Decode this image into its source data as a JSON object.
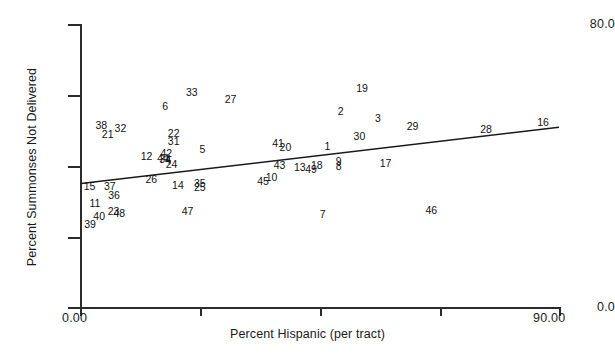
{
  "chart_data": {
    "type": "scatter",
    "title": "",
    "xlabel": "Percent Hispanic (per tract)",
    "ylabel": "Percent Summonses Not Delivered",
    "xlim": [
      0,
      90
    ],
    "ylim": [
      0,
      80
    ],
    "grid": false,
    "legend": "none",
    "marker_style": "numeric-text-label",
    "xtick_labels": [
      "0.00",
      "90.00"
    ],
    "xticks": [
      0,
      22.5,
      45,
      67.5,
      90
    ],
    "ytick_labels": [
      "80.0",
      "",
      "",
      "",
      "0.0"
    ],
    "yticks": [
      80,
      60,
      40,
      20,
      0
    ],
    "annotations": [
      {
        "label": "33",
        "x": 21.0,
        "y": 60.7
      },
      {
        "label": "27",
        "x": 28.3,
        "y": 58.8
      },
      {
        "label": "19",
        "x": 53.0,
        "y": 61.9
      },
      {
        "label": "6",
        "x": 16.0,
        "y": 56.8
      },
      {
        "label": "2",
        "x": 49.0,
        "y": 55.3
      },
      {
        "label": "3",
        "x": 56.0,
        "y": 53.4
      },
      {
        "label": "38",
        "x": 4.0,
        "y": 51.4
      },
      {
        "label": "32",
        "x": 7.6,
        "y": 50.6
      },
      {
        "label": "21",
        "x": 5.2,
        "y": 48.9
      },
      {
        "label": "29",
        "x": 62.5,
        "y": 51.1
      },
      {
        "label": "28",
        "x": 76.3,
        "y": 50.3
      },
      {
        "label": "16",
        "x": 87.0,
        "y": 52.4
      },
      {
        "label": "22",
        "x": 17.6,
        "y": 49.2
      },
      {
        "label": "31",
        "x": 17.6,
        "y": 47.0
      },
      {
        "label": "30",
        "x": 52.5,
        "y": 48.2
      },
      {
        "label": "41",
        "x": 37.2,
        "y": 46.5
      },
      {
        "label": "20",
        "x": 38.6,
        "y": 45.2
      },
      {
        "label": "1",
        "x": 46.5,
        "y": 45.6
      },
      {
        "label": "5",
        "x": 23.0,
        "y": 44.6
      },
      {
        "label": "12",
        "x": 12.5,
        "y": 42.8
      },
      {
        "label": "42",
        "x": 16.2,
        "y": 43.5
      },
      {
        "label": "44",
        "x": 15.6,
        "y": 42.2
      },
      {
        "label": "34",
        "x": 16.0,
        "y": 41.9
      },
      {
        "label": "4",
        "x": 16.5,
        "y": 41.6
      },
      {
        "label": "24",
        "x": 17.2,
        "y": 40.4
      },
      {
        "label": "43",
        "x": 37.5,
        "y": 40.2
      },
      {
        "label": "13",
        "x": 41.3,
        "y": 39.5
      },
      {
        "label": "18",
        "x": 44.5,
        "y": 40.2
      },
      {
        "label": "49",
        "x": 43.4,
        "y": 38.9
      },
      {
        "label": "9",
        "x": 48.6,
        "y": 41.3
      },
      {
        "label": "8",
        "x": 48.6,
        "y": 39.9
      },
      {
        "label": "17",
        "x": 57.4,
        "y": 40.6
      },
      {
        "label": "10",
        "x": 36.0,
        "y": 36.8
      },
      {
        "label": "45",
        "x": 34.4,
        "y": 35.6
      },
      {
        "label": "26",
        "x": 13.4,
        "y": 36.2
      },
      {
        "label": "14",
        "x": 18.4,
        "y": 34.6
      },
      {
        "label": "35",
        "x": 22.5,
        "y": 35.1
      },
      {
        "label": "25",
        "x": 22.5,
        "y": 33.8
      },
      {
        "label": "15",
        "x": 1.8,
        "y": 34.3
      },
      {
        "label": "37",
        "x": 5.6,
        "y": 34.3
      },
      {
        "label": "36",
        "x": 6.4,
        "y": 31.7
      },
      {
        "label": "11",
        "x": 2.8,
        "y": 29.4
      },
      {
        "label": "23",
        "x": 6.3,
        "y": 27.0
      },
      {
        "label": "48",
        "x": 7.4,
        "y": 26.5
      },
      {
        "label": "40",
        "x": 3.6,
        "y": 25.7
      },
      {
        "label": "39",
        "x": 1.9,
        "y": 23.4
      },
      {
        "label": "47",
        "x": 20.2,
        "y": 27.0
      },
      {
        "label": "7",
        "x": 45.6,
        "y": 26.3
      },
      {
        "label": "46",
        "x": 66.0,
        "y": 27.4
      }
    ],
    "regression_line": {
      "x_start": 0.2,
      "y_start": 34.9,
      "x_end": 90.0,
      "y_end": 50.8,
      "style": "solid",
      "color": "#1a1a1a"
    }
  },
  "axes": {
    "x_title": "Percent Hispanic (per tract)",
    "y_title": "Percent Summonses Not Delivered",
    "x_min_label": "0.00",
    "x_max_label": "90.00",
    "y_max_label": "80.0",
    "y_min_label": "0.0"
  },
  "colors": {
    "axis": "#2b2b2b",
    "text": "#111111",
    "line": "#1a1a1a",
    "background": "#ffffff"
  }
}
